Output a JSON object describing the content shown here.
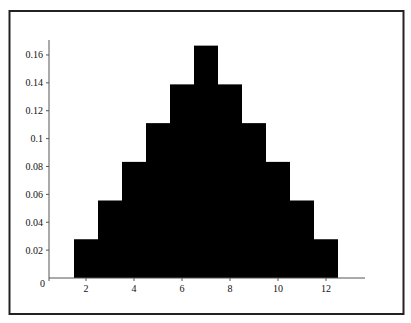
{
  "chart_data": {
    "type": "bar",
    "title": "",
    "xlabel": "",
    "ylabel": "",
    "categories": [
      2,
      3,
      4,
      5,
      6,
      7,
      8,
      9,
      10,
      11,
      12
    ],
    "values": [
      0.0278,
      0.0556,
      0.0833,
      0.1111,
      0.1389,
      0.1667,
      0.1389,
      0.1111,
      0.0833,
      0.0556,
      0.0278
    ],
    "xlim": [
      1,
      13.8
    ],
    "ylim": [
      0,
      0.17
    ],
    "x_ticks": [
      2,
      4,
      6,
      8,
      10,
      12
    ],
    "x_tick_labels": [
      "2",
      "4",
      "6",
      "8",
      "10",
      "12"
    ],
    "y_ticks": [
      0,
      0.02,
      0.04,
      0.06,
      0.08,
      0.1,
      0.12,
      0.14,
      0.16
    ],
    "y_tick_labels": [
      "0",
      "0.02",
      "0.04",
      "0.06",
      "0.08",
      "0.1",
      "0.12",
      "0.14",
      "0.16"
    ],
    "bar_color": "#000000",
    "grid": false,
    "legend": "none"
  }
}
